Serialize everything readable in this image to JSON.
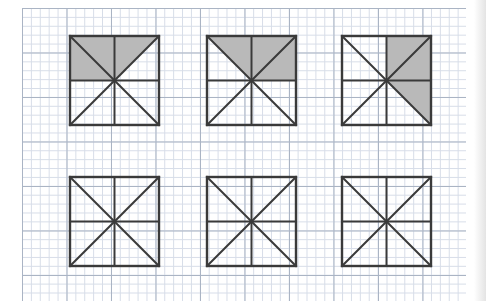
{
  "page": {
    "width": 486,
    "height": 301,
    "background_color": "#ffffff"
  },
  "grid": {
    "name": "graph-paper-grid",
    "fine_cell_px": 8.9,
    "major_every_cells": 5,
    "fine_line_color": "#d7dde8",
    "major_line_color": "#aab4c4",
    "left_px": 22,
    "top_px": 8,
    "right_px": 466,
    "bottom_px": 301
  },
  "figures": {
    "count": 6,
    "rows": 2,
    "columns": 3,
    "square_size_px": 89,
    "stroke_color": "#3a3a3a",
    "shade_color": "#b9b9b9",
    "description": "Each square is divided into eight congruent triangles by its two diagonals, a horizontal midline and a vertical midline.",
    "items": [
      {
        "id": "square-1",
        "label": "Square 1",
        "row": 1,
        "column": 1,
        "x": 70,
        "y": 36,
        "shaded_triangle_count": 3,
        "shaded_triangles": [
          "top-left-upper",
          "top-left-lower",
          "top-right-left"
        ],
        "shaded_fraction": "3/8"
      },
      {
        "id": "square-2",
        "label": "Square 2",
        "row": 1,
        "column": 2,
        "x": 207,
        "y": 36,
        "shaded_triangle_count": 3,
        "shaded_triangles": [
          "top-left-right",
          "top-right-left",
          "right-upper"
        ],
        "shaded_fraction": "3/8"
      },
      {
        "id": "square-3",
        "label": "Square 3",
        "row": 1,
        "column": 3,
        "x": 342,
        "y": 36,
        "shaded_triangle_count": 3,
        "shaded_triangles": [
          "top-right-left",
          "top-right-right",
          "right-lower"
        ],
        "shaded_fraction": "3/8"
      },
      {
        "id": "square-4",
        "label": "Square 4",
        "row": 2,
        "column": 1,
        "x": 70,
        "y": 177,
        "shaded_triangle_count": 0,
        "shaded_triangles": [],
        "shaded_fraction": "0/8"
      },
      {
        "id": "square-5",
        "label": "Square 5",
        "row": 2,
        "column": 2,
        "x": 207,
        "y": 177,
        "shaded_triangle_count": 0,
        "shaded_triangles": [],
        "shaded_fraction": "0/8"
      },
      {
        "id": "square-6",
        "label": "Square 6",
        "row": 2,
        "column": 3,
        "x": 342,
        "y": 177,
        "shaded_triangle_count": 0,
        "shaded_triangles": [],
        "shaded_fraction": "0/8"
      }
    ]
  }
}
